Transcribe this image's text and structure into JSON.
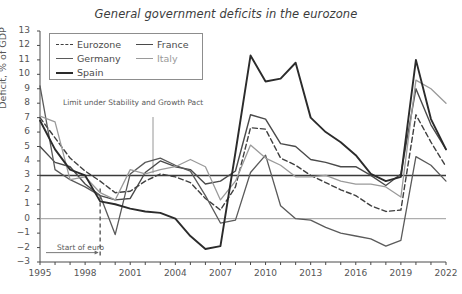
{
  "chart_data": {
    "type": "line",
    "title": "General government deficits in the eurozone",
    "xlabel": "",
    "ylabel": "Deficit, % of GDP",
    "ylim": [
      -3,
      13
    ],
    "xlim": [
      1995,
      2022
    ],
    "ytick_labels": [
      "13",
      "12",
      "11",
      "10",
      "9",
      "8",
      "7",
      "6",
      "5",
      "4",
      "3",
      "2",
      "1",
      "0",
      "-1",
      "-2",
      "-3"
    ],
    "xtick_labels": [
      "1995",
      "1998",
      "2001",
      "2004",
      "2007",
      "2010",
      "2013",
      "2016",
      "2019",
      "2022"
    ],
    "x": [
      1995,
      1996,
      1997,
      1998,
      1999,
      2000,
      2001,
      2002,
      2003,
      2004,
      2005,
      2006,
      2007,
      2008,
      2009,
      2010,
      2011,
      2012,
      2013,
      2014,
      2015,
      2016,
      2017,
      2018,
      2019,
      2020,
      2021,
      2022
    ],
    "grid": false,
    "legend_position": "top-left",
    "reference_lines": [
      {
        "value": 3,
        "label": "Limit under Stability and Growth Pact",
        "color": "#3a3a3a"
      },
      {
        "value": 0,
        "label": "",
        "color": "#9a9a9a"
      }
    ],
    "annotations": [
      {
        "text": "Limit under Stability and Growth Pact",
        "x": 2000,
        "y": 6.3
      },
      {
        "text": "Start of euro",
        "x": 1996.5,
        "y": -2.2
      }
    ],
    "event_marker": {
      "x": 1999,
      "label": "Start of euro",
      "style": "dashed"
    },
    "series": [
      {
        "name": "Eurozone",
        "color": "#3f3f3f",
        "style": "dashed",
        "width": 1.4,
        "values": [
          7.0,
          5.6,
          4.2,
          3.3,
          2.6,
          1.8,
          1.9,
          2.6,
          3.1,
          2.9,
          2.5,
          1.4,
          0.6,
          2.2,
          6.3,
          6.2,
          4.2,
          3.7,
          3.0,
          2.5,
          2.0,
          1.6,
          0.9,
          0.5,
          0.6,
          7.2,
          5.3,
          3.6
        ]
      },
      {
        "name": "France",
        "color": "#4a4a4a",
        "style": "solid",
        "width": 1.4,
        "values": [
          5.0,
          3.9,
          3.6,
          2.4,
          1.6,
          1.3,
          1.4,
          3.2,
          4.0,
          3.6,
          3.4,
          2.4,
          2.6,
          3.3,
          7.2,
          6.9,
          5.2,
          5.0,
          4.1,
          3.9,
          3.6,
          3.6,
          3.0,
          2.3,
          3.1,
          9.0,
          6.5,
          4.8
        ]
      },
      {
        "name": "Germany",
        "color": "#5a5a5a",
        "style": "solid",
        "width": 1.3,
        "values": [
          9.2,
          3.4,
          2.7,
          2.2,
          1.6,
          -1.1,
          3.1,
          3.9,
          4.2,
          3.7,
          3.3,
          1.6,
          -0.3,
          -0.1,
          3.2,
          4.4,
          0.9,
          0.0,
          -0.1,
          -0.6,
          -1.0,
          -1.2,
          -1.4,
          -1.9,
          -1.5,
          4.3,
          3.7,
          2.6
        ]
      },
      {
        "name": "Italy",
        "color": "#9a9a9a",
        "style": "solid",
        "width": 1.3,
        "values": [
          7.1,
          6.7,
          2.7,
          2.9,
          1.8,
          1.3,
          3.4,
          3.1,
          3.4,
          3.6,
          4.1,
          3.6,
          1.3,
          2.6,
          5.1,
          4.2,
          3.7,
          2.9,
          2.9,
          3.0,
          2.6,
          2.4,
          2.4,
          2.2,
          1.5,
          9.6,
          9.0,
          8.0
        ]
      },
      {
        "name": "Spain",
        "color": "#2b2b2b",
        "style": "solid",
        "width": 1.9,
        "values": [
          6.8,
          4.8,
          3.4,
          3.0,
          1.2,
          1.0,
          0.7,
          0.5,
          0.4,
          0.0,
          -1.2,
          -2.1,
          -1.9,
          4.6,
          11.3,
          9.5,
          9.7,
          10.8,
          7.0,
          6.0,
          5.3,
          4.4,
          3.1,
          2.6,
          2.9,
          11.0,
          6.9,
          4.8
        ]
      }
    ]
  },
  "caption": ""
}
